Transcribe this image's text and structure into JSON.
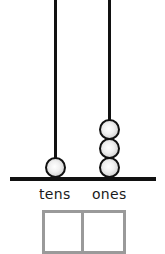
{
  "diagram": {
    "type": "place-value abacus",
    "columns": [
      {
        "label": "tens",
        "beads": 1
      },
      {
        "label": "ones",
        "beads": 3
      }
    ],
    "answer_boxes": [
      {
        "column": "tens",
        "value": ""
      },
      {
        "column": "ones",
        "value": ""
      }
    ],
    "colors": {
      "rod": "#111111",
      "base": "#111111",
      "bead_fill": "#e8e8e8",
      "bead_outline": "#111111",
      "box_border": "#9a9a9a"
    }
  }
}
